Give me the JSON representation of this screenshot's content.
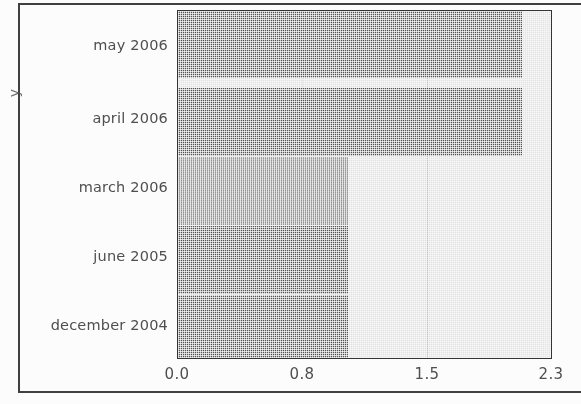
{
  "chart_data": {
    "type": "bar",
    "orientation": "horizontal",
    "title": "",
    "xlabel": "",
    "ylabel": "y",
    "categories": [
      "may 2006",
      "april 2006",
      "march 2006",
      "june 2005",
      "december 2004"
    ],
    "values": [
      2.12,
      2.12,
      1.05,
      1.05,
      1.05
    ],
    "xticks": [
      "0.0",
      "0.8",
      "1.5",
      "2.3"
    ],
    "xtick_values": [
      0.0,
      0.8,
      1.5,
      2.3
    ],
    "xlim": [
      0.0,
      2.3
    ],
    "grid": true,
    "legend": false,
    "colors": {
      "bar": "#787878",
      "plot_background": "#e3e3e3",
      "gridline": "#c2c2c2",
      "axis_border": "#2e2e2e",
      "text": "#4a4a4a",
      "page_frame": "#3b3b3b"
    }
  }
}
